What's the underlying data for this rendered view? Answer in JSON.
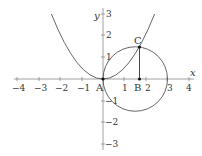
{
  "diagram": {
    "type": "coordinate-geometry",
    "axes": {
      "x_label": "x",
      "y_label": "y",
      "x_ticks": [
        "−4",
        "−3",
        "−2",
        "−1",
        "1",
        "2",
        "3",
        "4"
      ],
      "y_ticks": [
        "1",
        "2",
        "3",
        "−1",
        "−2",
        "−3"
      ]
    },
    "points": {
      "A": {
        "label": "A",
        "x": 0,
        "y": 0
      },
      "B": {
        "label": "B",
        "x": 1.7,
        "y": 0
      },
      "C": {
        "label": "C",
        "x": 1.7,
        "y": 1.45
      }
    },
    "curves": [
      {
        "name": "parabola",
        "equation": "y = x^2/2"
      },
      {
        "name": "circle",
        "center": [
          1.5,
          0
        ],
        "radius": 1.5
      }
    ],
    "segments": [
      {
        "from": "C",
        "to": "B"
      }
    ],
    "colors": {
      "curve": "#555555",
      "axis": "#777777",
      "point": "#111111"
    }
  }
}
